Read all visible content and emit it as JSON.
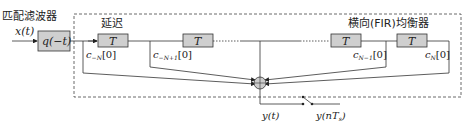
{
  "diagram": {
    "matched_filter_label": "匹配滤波器",
    "delay_label": "延迟",
    "equalizer_label": "横向(FIR)均衡器",
    "input_label": "x(t)",
    "filter_block": "q(−t)",
    "delay_block": "T",
    "taps": [
      {
        "label": "c",
        "sub": "−N",
        "suffix": "[0]"
      },
      {
        "label": "c",
        "sub": "−N+1",
        "suffix": "[0]"
      },
      {
        "label": "c",
        "sub": "N−1",
        "suffix": "[0]"
      },
      {
        "label": "c",
        "sub": "N",
        "suffix": "[0]"
      }
    ],
    "output_label": "y(t)",
    "sampled_output_label": "y(nT",
    "sampled_sub": "s",
    "sampled_close": ")"
  },
  "colors": {
    "block_fill": "#cfcfcf",
    "line": "#333333",
    "sum_fill": "#cccccc"
  }
}
